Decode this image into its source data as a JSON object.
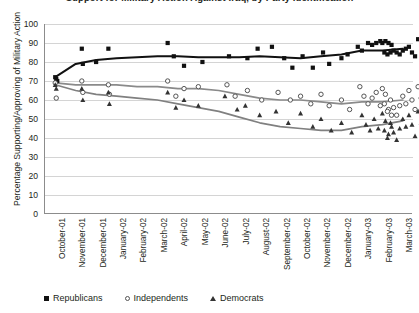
{
  "chart_title": "Support for Military Action Against Iraq, by Party Identification",
  "axes": {
    "ylabel": "Percentage Supporting/Approving of Military Action",
    "xlabel": "",
    "yticks": [
      0,
      10,
      20,
      30,
      40,
      50,
      60,
      70,
      80,
      90,
      100
    ],
    "ylim": [
      0,
      100
    ],
    "grid": "horizontal"
  },
  "legend": {
    "position": "bottom-left",
    "entries": [
      {
        "label": "Republicans",
        "marker": "filled-square",
        "color": "#111111"
      },
      {
        "label": "Independents",
        "marker": "open-circle",
        "color": "#555555"
      },
      {
        "label": "Democrats",
        "marker": "filled-triangle",
        "color": "#333333"
      }
    ]
  },
  "chart_data": {
    "type": "scatter",
    "title": "Support for Military Action Against Iraq, by Party Identification",
    "xlabel": "",
    "ylabel": "Percentage Supporting/Approving of Military Action",
    "ylim": [
      0,
      100
    ],
    "grid": true,
    "legend_position": "bottom-left",
    "categories": [
      "October-01",
      "November-01",
      "December-01",
      "January-02",
      "February-02",
      "March-02",
      "April-02",
      "May-02",
      "June-02",
      "July-02",
      "August-02",
      "September-02",
      "October-02",
      "November-02",
      "December-02",
      "January-03",
      "February-03",
      "March-03"
    ],
    "series": [
      {
        "name": "Republicans",
        "marker": "filled-square",
        "color": "#111111",
        "trend_color": "#111111",
        "points": [
          [
            0.0,
            72
          ],
          [
            0.05,
            71
          ],
          [
            0.1,
            70
          ],
          [
            1.3,
            87
          ],
          [
            2.6,
            87
          ],
          [
            1.35,
            79
          ],
          [
            2.0,
            80
          ],
          [
            5.5,
            90
          ],
          [
            5.8,
            83
          ],
          [
            6.3,
            78
          ],
          [
            7.2,
            80
          ],
          [
            8.5,
            83
          ],
          [
            9.4,
            82
          ],
          [
            9.9,
            87
          ],
          [
            10.6,
            88
          ],
          [
            11.2,
            82
          ],
          [
            11.6,
            77
          ],
          [
            12.1,
            83
          ],
          [
            12.6,
            77
          ],
          [
            13.1,
            85
          ],
          [
            13.4,
            79
          ],
          [
            14.0,
            82
          ],
          [
            14.3,
            84
          ],
          [
            14.8,
            88
          ],
          [
            15.0,
            86
          ],
          [
            15.3,
            90
          ],
          [
            15.5,
            89
          ],
          [
            15.7,
            90
          ],
          [
            15.9,
            91
          ],
          [
            16.0,
            90
          ],
          [
            16.15,
            91
          ],
          [
            16.3,
            90
          ],
          [
            16.45,
            89
          ],
          [
            16.1,
            85
          ],
          [
            16.25,
            84
          ],
          [
            16.4,
            85
          ],
          [
            16.55,
            86
          ],
          [
            16.7,
            85
          ],
          [
            16.85,
            84
          ],
          [
            17.0,
            86
          ],
          [
            17.15,
            87
          ],
          [
            17.3,
            88
          ],
          [
            17.45,
            85
          ],
          [
            17.6,
            83
          ],
          [
            17.75,
            92
          ],
          [
            17.9,
            86
          ]
        ],
        "trend": [
          [
            0,
            72
          ],
          [
            1,
            79
          ],
          [
            2,
            81
          ],
          [
            3,
            82
          ],
          [
            4,
            82.5
          ],
          [
            5,
            83
          ],
          [
            6,
            83
          ],
          [
            7,
            82.5
          ],
          [
            8,
            82.5
          ],
          [
            9,
            82.5
          ],
          [
            10,
            83
          ],
          [
            11,
            82.5
          ],
          [
            12,
            82
          ],
          [
            13,
            83
          ],
          [
            14,
            84
          ],
          [
            15,
            86
          ],
          [
            16,
            86
          ],
          [
            17,
            87
          ]
        ]
      },
      {
        "name": "Independents",
        "marker": "open-circle",
        "color": "#555555",
        "trend_color": "#8a8a8a",
        "points": [
          [
            0.0,
            69
          ],
          [
            0.05,
            61
          ],
          [
            1.3,
            70
          ],
          [
            1.35,
            64
          ],
          [
            2.6,
            68
          ],
          [
            2.65,
            63
          ],
          [
            5.5,
            70
          ],
          [
            5.9,
            62
          ],
          [
            6.3,
            66
          ],
          [
            7.0,
            67
          ],
          [
            8.4,
            68
          ],
          [
            8.8,
            62
          ],
          [
            9.4,
            65
          ],
          [
            10.1,
            60
          ],
          [
            10.9,
            64
          ],
          [
            11.5,
            60
          ],
          [
            12.0,
            62
          ],
          [
            12.5,
            58
          ],
          [
            13.0,
            63
          ],
          [
            13.4,
            57
          ],
          [
            14.0,
            60
          ],
          [
            14.4,
            55
          ],
          [
            14.9,
            67
          ],
          [
            15.1,
            62
          ],
          [
            15.3,
            58
          ],
          [
            15.5,
            61
          ],
          [
            15.7,
            64
          ],
          [
            15.9,
            57
          ],
          [
            16.0,
            66
          ],
          [
            16.15,
            63
          ],
          [
            16.3,
            55
          ],
          [
            16.45,
            52
          ],
          [
            16.1,
            58
          ],
          [
            16.25,
            54
          ],
          [
            16.4,
            60
          ],
          [
            16.55,
            56
          ],
          [
            16.7,
            52
          ],
          [
            16.85,
            57
          ],
          [
            17.0,
            62
          ],
          [
            17.15,
            58
          ],
          [
            17.3,
            65
          ],
          [
            17.45,
            60
          ],
          [
            17.6,
            55
          ],
          [
            17.75,
            67
          ],
          [
            17.9,
            61
          ],
          [
            17.95,
            53
          ]
        ],
        "trend": [
          [
            0,
            69
          ],
          [
            1,
            68
          ],
          [
            2,
            68
          ],
          [
            3,
            68
          ],
          [
            4,
            67
          ],
          [
            5,
            67
          ],
          [
            6,
            66
          ],
          [
            7,
            66
          ],
          [
            8,
            65
          ],
          [
            9,
            63
          ],
          [
            10,
            61
          ],
          [
            11,
            60
          ],
          [
            12,
            60
          ],
          [
            13,
            59
          ],
          [
            14,
            58
          ],
          [
            15,
            59
          ],
          [
            16,
            59
          ],
          [
            17,
            60
          ]
        ]
      },
      {
        "name": "Democrats",
        "marker": "filled-triangle",
        "color": "#333333",
        "trend_color": "#808080",
        "points": [
          [
            0.0,
            68
          ],
          [
            0.05,
            66
          ],
          [
            1.3,
            66
          ],
          [
            1.35,
            60
          ],
          [
            2.6,
            64
          ],
          [
            2.65,
            58
          ],
          [
            5.5,
            64
          ],
          [
            5.9,
            56
          ],
          [
            6.3,
            60
          ],
          [
            7.0,
            57
          ],
          [
            8.3,
            62
          ],
          [
            8.9,
            55
          ],
          [
            9.3,
            57
          ],
          [
            10.0,
            52
          ],
          [
            10.8,
            54
          ],
          [
            11.4,
            48
          ],
          [
            12.0,
            53
          ],
          [
            12.6,
            46
          ],
          [
            13.0,
            50
          ],
          [
            13.5,
            44
          ],
          [
            14.0,
            48
          ],
          [
            14.5,
            43
          ],
          [
            15.0,
            52
          ],
          [
            15.2,
            47
          ],
          [
            15.4,
            44
          ],
          [
            15.6,
            50
          ],
          [
            15.8,
            45
          ],
          [
            16.0,
            53
          ],
          [
            16.15,
            49
          ],
          [
            16.3,
            42
          ],
          [
            16.45,
            46
          ],
          [
            16.1,
            44
          ],
          [
            16.25,
            40
          ],
          [
            16.4,
            48
          ],
          [
            16.55,
            43
          ],
          [
            16.7,
            39
          ],
          [
            16.85,
            45
          ],
          [
            17.0,
            50
          ],
          [
            17.15,
            46
          ],
          [
            17.3,
            52
          ],
          [
            17.45,
            47
          ],
          [
            17.6,
            41
          ],
          [
            17.75,
            54
          ],
          [
            17.9,
            48
          ],
          [
            17.95,
            43
          ]
        ],
        "trend": [
          [
            0,
            68
          ],
          [
            1,
            65
          ],
          [
            2,
            63
          ],
          [
            3,
            62
          ],
          [
            4,
            61
          ],
          [
            5,
            60
          ],
          [
            6,
            58
          ],
          [
            7,
            56
          ],
          [
            8,
            54
          ],
          [
            9,
            51
          ],
          [
            10,
            48
          ],
          [
            11,
            46
          ],
          [
            12,
            45
          ],
          [
            13,
            44
          ],
          [
            14,
            44
          ],
          [
            15,
            46
          ],
          [
            16,
            47
          ],
          [
            17,
            49
          ]
        ]
      }
    ]
  }
}
